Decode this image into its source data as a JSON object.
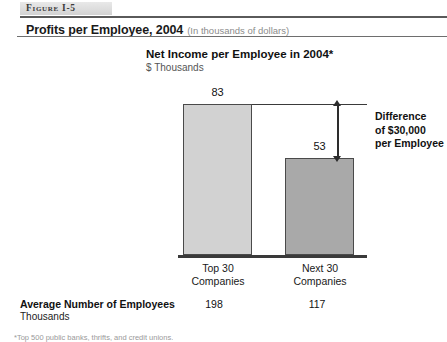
{
  "figure": {
    "tag": "Figure I-5",
    "title_main": "Profits per Employee, 2004",
    "title_sub": "(In thousands of dollars)"
  },
  "footer_row": {
    "label_line1": "Average Number of Employees",
    "label_line2": "Thousands",
    "value_a": "198",
    "value_b": "117"
  },
  "annotation": {
    "line1": "Difference",
    "line2": "of $30,000",
    "line3": "per Employee"
  },
  "footnote": "*Top 500 public banks, thrifts, and credit unions.",
  "colors": {
    "bar_top30": "#d2d2d2",
    "bar_next30": "#a9a9a9",
    "outline": "#4a4a4a",
    "baseline": "#3a3a3a",
    "text": "#111111",
    "muted_text": "#8c8c8c"
  },
  "chart_data": {
    "type": "bar",
    "title": "Net Income per Employee in 2004*",
    "subtitle": "$ Thousands",
    "xlabel": "",
    "ylabel": "$ Thousands",
    "ylim": [
      0,
      90
    ],
    "grid": false,
    "legend": "none",
    "categories": [
      "Top 30 Companies",
      "Next 30 Companies"
    ],
    "category_lines": [
      [
        "Top 30",
        "Companies"
      ],
      [
        "Next 30",
        "Companies"
      ]
    ],
    "values": [
      83,
      53
    ],
    "data_labels": [
      "83",
      "53"
    ],
    "annotations": [
      {
        "text": "Difference of $30,000 per Employee",
        "type": "double-headed-arrow",
        "from_value": 83,
        "to_value": 53,
        "delta": 30
      }
    ],
    "secondary_table": {
      "row_label": "Average Number of Employees",
      "row_units": "Thousands",
      "values": [
        198,
        117
      ]
    }
  }
}
